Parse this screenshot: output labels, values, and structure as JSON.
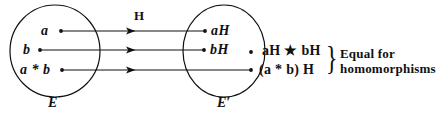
{
  "figure": {
    "stroke_color": "#111111",
    "background_color": "#ffffff"
  },
  "domain_set": {
    "label": "E",
    "elements": [
      {
        "text": "a"
      },
      {
        "text": "b"
      },
      {
        "text": "a * b"
      }
    ]
  },
  "codomain_set": {
    "label": "E′",
    "elements": [
      {
        "text": "aH"
      },
      {
        "text": "bH"
      }
    ]
  },
  "map": {
    "label": "H",
    "arrow_count": 3
  },
  "formulas": [
    {
      "left": "a",
      "op": "H ★ ",
      "right": "b",
      "tail": "H",
      "text": "aH ★ bH"
    },
    {
      "text": "(a * b) H"
    }
  ],
  "annotation": {
    "line1": "Equal for",
    "line2": "homomorphisms",
    "brace": "}"
  }
}
